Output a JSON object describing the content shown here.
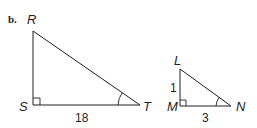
{
  "part_label": "b.",
  "triangle_1": {
    "vertices": {
      "top": "R",
      "right_angle": "S",
      "acute": "T"
    },
    "side_labels": {
      "base": "18"
    }
  },
  "triangle_2": {
    "vertices": {
      "top": "L",
      "right_angle": "M",
      "acute": "N"
    },
    "side_labels": {
      "leg": "1",
      "base": "3"
    }
  },
  "colors": {
    "stroke": "#231f20",
    "background": "#ffffff"
  }
}
